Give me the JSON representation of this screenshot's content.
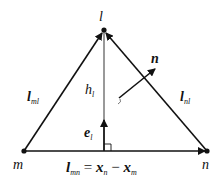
{
  "diagram": {
    "type": "triangle-geometry",
    "colors": {
      "stroke": "#111111",
      "background": "#ffffff"
    },
    "vertices": {
      "l": {
        "label": "l",
        "x": 104,
        "y": 30
      },
      "m": {
        "label": "m",
        "x": 24,
        "y": 151
      },
      "n": {
        "label": "n",
        "x": 207,
        "y": 151
      }
    },
    "labels": {
      "vertex_l": "l",
      "vertex_m": "m",
      "vertex_n": "n",
      "edge_ml": {
        "main": "l",
        "sub": "ml"
      },
      "edge_nl": {
        "main": "l",
        "sub": "nl"
      },
      "height": {
        "main": "h",
        "sub": "l"
      },
      "unit_vector": {
        "main": "e",
        "sub": "l"
      },
      "normal": "n",
      "equation": {
        "lhs_main": "l",
        "lhs_sub": "mn",
        "eq": "=",
        "x1_main": "x",
        "x1_sub": "n",
        "minus": "−",
        "x2_main": "x",
        "x2_sub": "m"
      }
    }
  }
}
